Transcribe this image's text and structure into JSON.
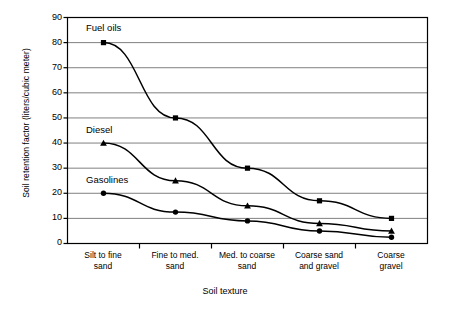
{
  "chart_data": {
    "type": "line",
    "title": "",
    "xlabel": "Soil texture",
    "ylabel": "Soil retention factor (liters/cubic meter)",
    "categories": [
      "Silt to fine sand",
      "Fine to med. sand",
      "Med. to coarse sand",
      "Coarse sand and gravel",
      "Coarse gravel"
    ],
    "category_lines": [
      [
        "Silt to fine",
        "sand"
      ],
      [
        "Fine to med.",
        "sand"
      ],
      [
        "Med. to coarse",
        "sand"
      ],
      [
        "Coarse sand",
        "and gravel"
      ],
      [
        "Coarse",
        "gravel"
      ]
    ],
    "ylim": [
      0,
      90
    ],
    "yticks": [
      0,
      10,
      20,
      30,
      40,
      50,
      60,
      70,
      80,
      90
    ],
    "grid": true,
    "legend": "inline-labels",
    "series": [
      {
        "name": "Fuel oils",
        "marker": "square",
        "values": [
          80,
          50,
          30,
          17,
          10
        ]
      },
      {
        "name": "Diesel",
        "marker": "triangle",
        "values": [
          40,
          25,
          15,
          8,
          5
        ]
      },
      {
        "name": "Gasolines",
        "marker": "circle",
        "values": [
          20,
          12.5,
          9,
          5,
          2.5
        ]
      }
    ],
    "colors": {
      "line": "#000000",
      "grid": "#808080",
      "axis": "#000000",
      "background": "#ffffff"
    }
  },
  "annotations": {
    "fuel_oils_label": "Fuel oils",
    "diesel_label": "Diesel",
    "gasolines_label": "Gasolines"
  }
}
